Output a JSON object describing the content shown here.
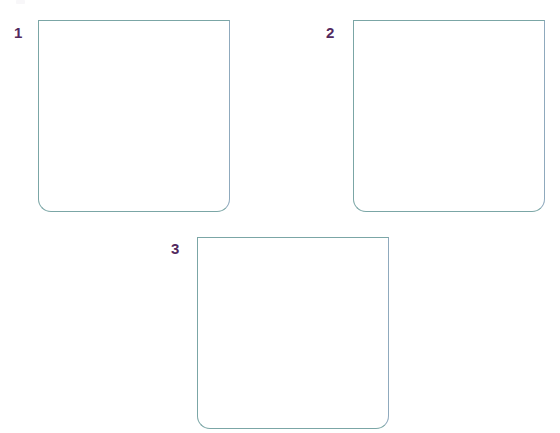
{
  "page": {
    "background_color": "#ffffff",
    "width": 560,
    "height": 433
  },
  "style": {
    "box_border_color": "#7ba6a6",
    "box_border_right_color": "#8fa9bd",
    "box_fill_color": "#ffffff",
    "label_color": "#52295e",
    "box_border_width_px": 1.5,
    "box_corner_radius_bottom_px": 13,
    "box_corner_radius_top_px": 0
  },
  "artifact": {
    "name": "clipped-mark",
    "x": 16,
    "y": 0,
    "width": 9,
    "height": 4
  },
  "boxes": [
    {
      "id": "box-1",
      "label": "1",
      "content": "",
      "x": 38,
      "y": 20,
      "width": 192,
      "height": 192,
      "label_x": 14,
      "label_y": 25
    },
    {
      "id": "box-2",
      "label": "2",
      "content": "",
      "x": 353,
      "y": 20,
      "width": 192,
      "height": 192,
      "label_x": 326,
      "label_y": 25
    },
    {
      "id": "box-3",
      "label": "3",
      "content": "",
      "x": 197,
      "y": 237,
      "width": 192,
      "height": 192,
      "label_x": 171,
      "label_y": 241
    }
  ]
}
